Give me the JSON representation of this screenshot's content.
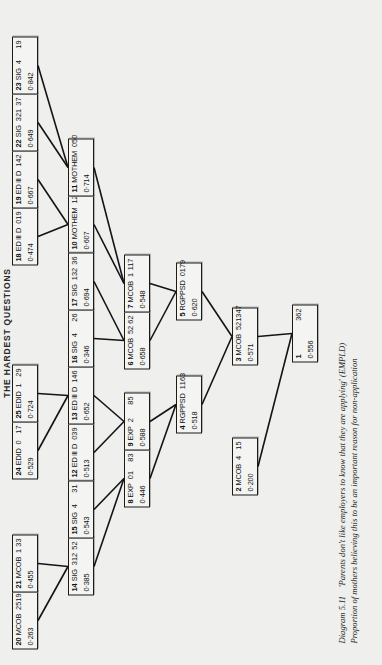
{
  "page": {
    "header": "THE HARDEST QUESTIONS",
    "figure_label": "Diagram 5.11",
    "caption_line1": "'Parents don't like employers to know that they are applying' (EMPLD)",
    "caption_line2": "Proportion of mothers believing this to be an important reason for non-application"
  },
  "tree": {
    "nodes": [
      {
        "id": "1",
        "variable": "",
        "category": "",
        "n": "362",
        "proportion": "0·556",
        "count": ""
      },
      {
        "id": "2",
        "variable": "MCOB",
        "category": "4",
        "n": "15",
        "proportion": "0·200",
        "count": ""
      },
      {
        "id": "3",
        "variable": "MCOB",
        "category": "521",
        "n": "347",
        "proportion": "0·571",
        "count": ""
      },
      {
        "id": "4",
        "variable": "RGPPSD",
        "category": "1",
        "n": "163",
        "proportion": "0·518",
        "count": ""
      },
      {
        "id": "5",
        "variable": "RGPPSD",
        "category": "0",
        "n": "179",
        "proportion": "0·620",
        "count": ""
      },
      {
        "id": "6",
        "variable": "MCOB",
        "category": "52",
        "n": "62",
        "proportion": "0·658",
        "count": ""
      },
      {
        "id": "7",
        "variable": "MCOB",
        "category": "1",
        "n": "117",
        "proportion": "0·548",
        "count": ""
      },
      {
        "id": "8",
        "variable": "EXP",
        "category": "01",
        "n": "83",
        "proportion": "0·446",
        "count": ""
      },
      {
        "id": "9",
        "variable": "EXP",
        "category": "2",
        "n": "85",
        "proportion": "0·588",
        "count": ""
      },
      {
        "id": "10",
        "variable": "MOTHEM",
        "category": "12",
        "n": "61",
        "proportion": "0·607",
        "count": ""
      },
      {
        "id": "11",
        "variable": "MOTHEM",
        "category": "0",
        "n": "50",
        "proportion": "0·714",
        "count": ""
      },
      {
        "id": "12",
        "variable": "ED Ⅲ D",
        "category": "0",
        "n": "39",
        "proportion": "0·513",
        "count": ""
      },
      {
        "id": "13",
        "variable": "ED Ⅲ D",
        "category": "1",
        "n": "46",
        "proportion": "0·652",
        "count": ""
      },
      {
        "id": "14",
        "variable": "SIG",
        "category": "312",
        "n": "52",
        "proportion": "0·385",
        "count": ""
      },
      {
        "id": "15",
        "variable": "SIG",
        "category": "4",
        "n": "31",
        "proportion": "0·543",
        "count": ""
      },
      {
        "id": "16",
        "variable": "SIG",
        "category": "4",
        "n": "26",
        "proportion": "0·346",
        "count": ""
      },
      {
        "id": "17",
        "variable": "SIG",
        "category": "132",
        "n": "36",
        "proportion": "0·694",
        "count": ""
      },
      {
        "id": "18",
        "variable": "ED Ⅲ D",
        "category": "0",
        "n": "19",
        "proportion": "0·474",
        "count": ""
      },
      {
        "id": "19",
        "variable": "ED Ⅲ D",
        "category": "1",
        "n": "42",
        "proportion": "0·667",
        "count": ""
      },
      {
        "id": "20",
        "variable": "MCOB",
        "category": "25",
        "n": "19",
        "proportion": "0·263",
        "count": ""
      },
      {
        "id": "21",
        "variable": "MCOB",
        "category": "1",
        "n": "33",
        "proportion": "0·455",
        "count": ""
      },
      {
        "id": "22",
        "variable": "SIG",
        "category": "321",
        "n": "37",
        "proportion": "0·649",
        "count": ""
      },
      {
        "id": "23",
        "variable": "SIG",
        "category": "4",
        "n": "19",
        "proportion": "0·842",
        "count": ""
      },
      {
        "id": "24",
        "variable": "EDID",
        "category": "0",
        "n": "17",
        "proportion": "0·529",
        "count": ""
      },
      {
        "id": "25",
        "variable": "EDID",
        "category": "1",
        "n": "29",
        "proportion": "0·724",
        "count": ""
      }
    ],
    "edges": [
      [
        "1",
        "2"
      ],
      [
        "1",
        "3"
      ],
      [
        "3",
        "4"
      ],
      [
        "3",
        "5"
      ],
      [
        "4",
        "8"
      ],
      [
        "4",
        "9"
      ],
      [
        "5",
        "6"
      ],
      [
        "5",
        "7"
      ],
      [
        "8",
        "14"
      ],
      [
        "8",
        "15"
      ],
      [
        "9",
        "12"
      ],
      [
        "9",
        "13"
      ],
      [
        "6",
        "16"
      ],
      [
        "6",
        "17"
      ],
      [
        "7",
        "10"
      ],
      [
        "7",
        "11"
      ],
      [
        "14",
        "20"
      ],
      [
        "14",
        "21"
      ],
      [
        "13",
        "24"
      ],
      [
        "13",
        "25"
      ],
      [
        "10",
        "18"
      ],
      [
        "10",
        "19"
      ],
      [
        "11",
        "22"
      ],
      [
        "11",
        "23"
      ]
    ]
  }
}
